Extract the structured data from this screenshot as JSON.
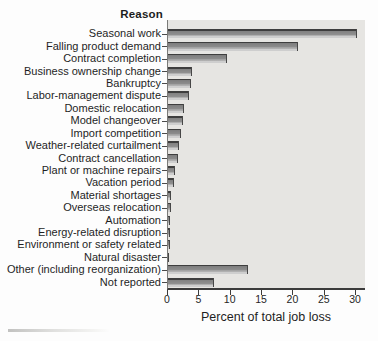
{
  "chart_data": {
    "type": "bar",
    "orientation": "horizontal",
    "title": "Reason",
    "xlabel": "Percent of total job loss",
    "xlim": [
      0,
      30
    ],
    "xticks": [
      0,
      5,
      10,
      15,
      20,
      25,
      30
    ],
    "grid": false,
    "legend": "none",
    "bar_color": "#8f8f8f",
    "bar_edge_color": "#3e3e3e",
    "plot_bg_color": "#e6e5e2",
    "categories": [
      "Seasonal work",
      "Falling product demand",
      "Contract completion",
      "Business ownership change",
      "Bankruptcy",
      "Labor-management dispute",
      "Domestic relocation",
      "Model changeover",
      "Import competition",
      "Weather-related curtailment",
      "Contract cancellation",
      "Plant or machine repairs",
      "Vacation period",
      "Material shortages",
      "Overseas relocation",
      "Automation",
      "Energy-related disruption",
      "Environment or safety related",
      "Natural disaster",
      "Other (including reorganization)",
      "Not reported"
    ],
    "values": [
      30.2,
      20.8,
      9.4,
      3.9,
      3.7,
      3.3,
      2.5,
      2.4,
      2.1,
      1.8,
      1.6,
      1.1,
      0.9,
      0.5,
      0.4,
      0.3,
      0.3,
      0.3,
      0.2,
      12.7,
      7.4
    ]
  }
}
